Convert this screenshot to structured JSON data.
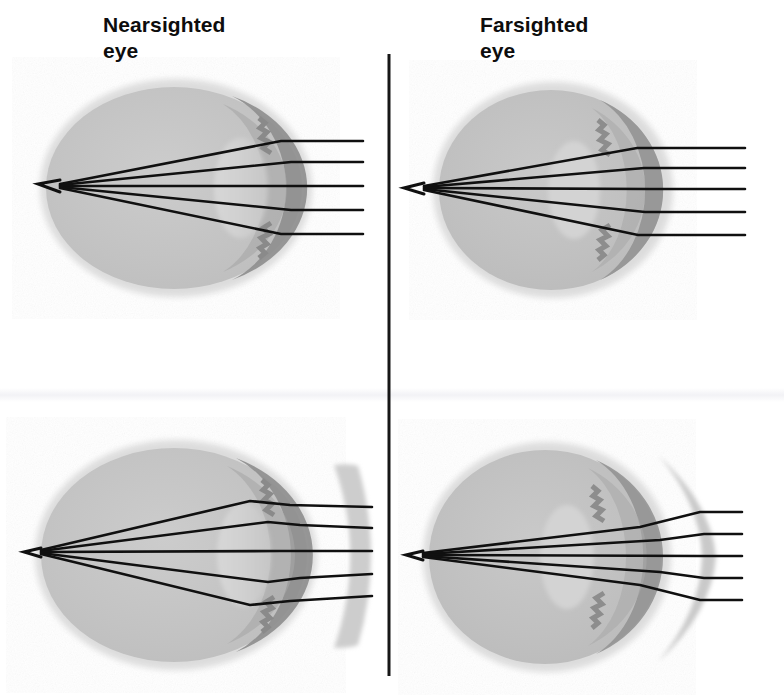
{
  "figure": {
    "width": 784,
    "height": 699,
    "background_color": "#ffffff",
    "topic": "Refractive errors of the eye and their corrective lenses"
  },
  "labels": {
    "nearsighted": "Nearsighted\neye",
    "farsighted": "Farsighted\neye"
  },
  "divider": {
    "orientation": "vertical",
    "x": 389,
    "y_top": 54,
    "y_bottom": 676,
    "color": "#161616",
    "width_px": 3
  },
  "colors": {
    "sclera_halo": "#d9d9d9",
    "vitreous": "#c4c4c4",
    "choroid_band": "#8d8d8d",
    "anterior_chamber": "#a8a8a8",
    "crystalline_lens": "#d2d2d2",
    "ray_stroke": "#101010",
    "corrective_lens": "#c9c9c9",
    "label_text": "#0d0d0d"
  },
  "panels": [
    {
      "id": "panel-nearsighted-uncorrected",
      "name": "nearsighted-eye-uncorrected",
      "row": "top",
      "column": "left",
      "condition": "Nearsighted eye",
      "condition_term": "myopia",
      "corrective_lens": "none",
      "focal_point_description": "rays converge in front of the retina, inside the vitreous chamber",
      "ray_count": 5,
      "eye": {
        "cx": 176,
        "cy": 188,
        "rx": 131,
        "ry": 104
      },
      "focus": {
        "x": 60,
        "y": 184
      },
      "ray_entry_x": 363,
      "ray_y_positions": [
        141,
        162,
        186,
        210,
        234
      ]
    },
    {
      "id": "panel-farsighted-uncorrected",
      "name": "farsighted-eye-uncorrected",
      "row": "top",
      "column": "right",
      "condition": "Farsighted eye",
      "condition_term": "hyperopia",
      "corrective_lens": "none",
      "focal_point_description": "rays converge at or behind the back wall of the eye",
      "ray_count": 5,
      "eye": {
        "cx": 553,
        "cy": 190,
        "rx": 116,
        "ry": 104
      },
      "focus": {
        "x": 424,
        "y": 188
      },
      "ray_entry_x": 745,
      "ray_y_positions": [
        148,
        168,
        189,
        212,
        235
      ]
    },
    {
      "id": "panel-nearsighted-corrected",
      "name": "nearsighted-eye-with-concave-lens",
      "row": "bottom",
      "column": "left",
      "condition": "Nearsighted eye",
      "condition_term": "myopia",
      "corrective_lens": "concave-diverging-lens",
      "corrective_lens_description": "thin crescent arc curving away from the eye; diverges incoming rays",
      "focal_point_description": "rays converge onto the retina after passing through the concave lens",
      "ray_count": 5,
      "eye": {
        "cx": 176,
        "cy": 555,
        "rx": 136,
        "ry": 110
      },
      "focus": {
        "x": 41,
        "y": 552
      },
      "ray_entry_x": 372,
      "ray_y_positions": [
        508,
        528,
        551,
        574,
        596
      ]
    },
    {
      "id": "panel-farsighted-corrected",
      "name": "farsighted-eye-with-convex-lens",
      "row": "bottom",
      "column": "right",
      "condition": "Farsighted eye",
      "condition_term": "hyperopia",
      "corrective_lens": "convex-converging-lens",
      "corrective_lens_description": "biconvex lens, thick at the centre and tapering to points; converges incoming rays",
      "focal_point_description": "rays converge onto the retina after passing through the convex lens",
      "ray_count": 5,
      "eye": {
        "cx": 547,
        "cy": 557,
        "rx": 119,
        "ry": 110
      },
      "focus": {
        "x": 423,
        "y": 555
      },
      "ray_entry_x": 742,
      "ray_y_positions": [
        512,
        534,
        556,
        578,
        600
      ]
    }
  ]
}
